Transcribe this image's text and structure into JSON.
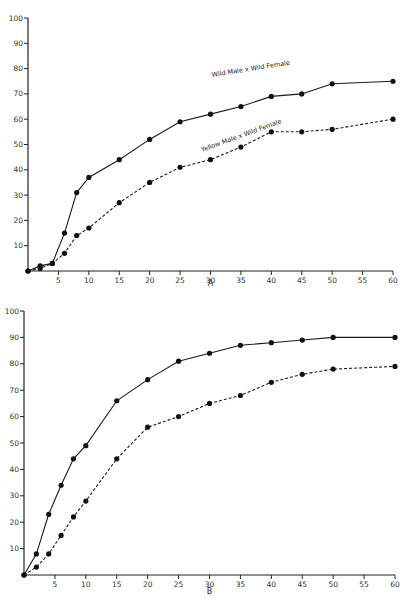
{
  "chart_data": [
    {
      "type": "line",
      "panel_label": "A",
      "title": "",
      "xlabel": "",
      "ylabel": "",
      "xlim": [
        0,
        60
      ],
      "ylim": [
        0,
        100
      ],
      "grid": false,
      "x_ticks": [
        5,
        10,
        15,
        20,
        25,
        30,
        35,
        40,
        45,
        50,
        55,
        60
      ],
      "x_tick_labels": [
        "5",
        "10",
        "15",
        "20",
        "25",
        "30",
        "35",
        "40",
        "45",
        "50",
        "55",
        "60"
      ],
      "y_ticks": [
        10,
        20,
        30,
        40,
        50,
        60,
        70,
        80,
        90,
        100
      ],
      "y_tick_labels": [
        "10",
        "20",
        "30",
        "40",
        "50",
        "60",
        "70",
        "80",
        "90",
        "100"
      ],
      "series": [
        {
          "name": "Wild Male x Wild Female",
          "style": "solid",
          "x": [
            0,
            2,
            4,
            6,
            8,
            10,
            15,
            20,
            25,
            30,
            35,
            40,
            45,
            50,
            60
          ],
          "values": [
            0,
            2,
            3,
            15,
            31,
            37,
            44,
            52,
            59,
            62,
            65,
            69,
            70,
            74,
            75
          ]
        },
        {
          "name": "Yellow Male x Wild Female",
          "style": "dashed",
          "x": [
            0,
            2,
            4,
            6,
            8,
            10,
            15,
            20,
            25,
            30,
            35,
            40,
            45,
            50,
            60
          ],
          "values": [
            0,
            1,
            3,
            7,
            14,
            17,
            27,
            35,
            41,
            44,
            49,
            55,
            55,
            56,
            60
          ]
        }
      ],
      "annotations": [
        "Wild Male x Wild Female",
        "Yellow Male x Wild Female"
      ]
    },
    {
      "type": "line",
      "panel_label": "B",
      "title": "",
      "xlabel": "",
      "ylabel": "",
      "xlim": [
        0,
        60
      ],
      "ylim": [
        0,
        100
      ],
      "grid": false,
      "x_ticks": [
        5,
        10,
        15,
        20,
        25,
        30,
        35,
        40,
        45,
        50,
        55,
        60
      ],
      "x_tick_labels": [
        "5",
        "10",
        "15",
        "20",
        "25",
        "30",
        "35",
        "40",
        "45",
        "50",
        "55",
        "60"
      ],
      "y_ticks": [
        10,
        20,
        30,
        40,
        50,
        60,
        70,
        80,
        90,
        100
      ],
      "y_tick_labels": [
        "10",
        "20",
        "30",
        "40",
        "50",
        "60",
        "70",
        "80",
        "90",
        "100"
      ],
      "series": [
        {
          "name": "solid",
          "style": "solid",
          "x": [
            0,
            2,
            4,
            6,
            8,
            10,
            15,
            20,
            25,
            30,
            35,
            40,
            45,
            50,
            60
          ],
          "values": [
            0,
            8,
            23,
            34,
            44,
            49,
            66,
            74,
            81,
            84,
            87,
            88,
            89,
            90,
            90
          ]
        },
        {
          "name": "dashed",
          "style": "dashed",
          "x": [
            0,
            2,
            4,
            6,
            8,
            10,
            15,
            20,
            25,
            30,
            35,
            40,
            45,
            50,
            60
          ],
          "values": [
            0,
            3,
            8,
            15,
            22,
            28,
            44,
            56,
            60,
            65,
            68,
            73,
            76,
            78,
            79
          ]
        }
      ],
      "annotations": []
    }
  ]
}
